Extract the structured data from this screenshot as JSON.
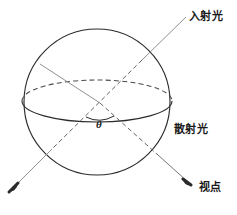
{
  "figure": {
    "kind": "optics-scattering-sphere-diagram",
    "background_color": "#ffffff",
    "stroke_color": "#2b2b2b",
    "ray_color": "#6f6f6f",
    "dash_color": "#5a5a5a",
    "labels": {
      "incident_light": "入射光",
      "scattered_light": "散射光",
      "viewpoint": "视点",
      "angle_symbol": "θ"
    },
    "geometry": {
      "sphere_center": [
        97,
        102
      ],
      "sphere_radius": 73,
      "equator_rx": 75,
      "equator_ry": 21,
      "angle_vertex": [
        100,
        103
      ],
      "incident_ray_start": [
        186,
        17
      ],
      "incident_ray_end": [
        11,
        190
      ],
      "scattered_ray_start": [
        46,
        72
      ],
      "scattered_ray_end": [
        189,
        183
      ]
    }
  }
}
